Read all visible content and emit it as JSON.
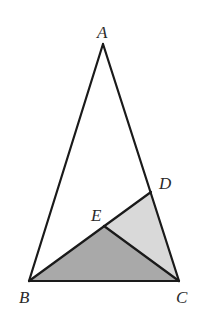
{
  "diagram": {
    "type": "geometry-triangle",
    "points": {
      "A": {
        "label": "A",
        "x": 103,
        "y": 44
      },
      "B": {
        "label": "B",
        "x": 29,
        "y": 281
      },
      "C": {
        "label": "C",
        "x": 179,
        "y": 281
      },
      "D": {
        "label": "D",
        "x": 151,
        "y": 192
      },
      "E": {
        "label": "E",
        "x": 104,
        "y": 226
      }
    },
    "segments": [
      "AB",
      "AC",
      "BC",
      "BD",
      "EC"
    ],
    "shaded_regions": [
      {
        "name": "triangle-BEC",
        "vertices": [
          "B",
          "E",
          "C"
        ],
        "fill": "#a9a9a9"
      },
      {
        "name": "triangle-EDC",
        "vertices": [
          "E",
          "D",
          "C"
        ],
        "fill": "#d9d9d9"
      }
    ],
    "stroke_color": "#1a1a1a",
    "labels": {
      "A": "A",
      "B": "B",
      "C": "C",
      "D": "D",
      "E": "E"
    }
  }
}
